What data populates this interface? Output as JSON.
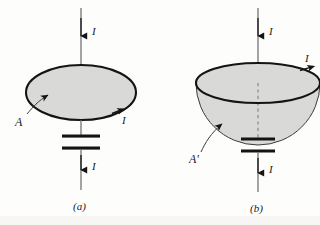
{
  "figure": {
    "background_color": "#fdfdfc",
    "ink_color": "#1a1a1a",
    "surface_fill_color": "#d9d9d7",
    "surface_edge_color": "#141414"
  },
  "panels": [
    {
      "id": "a",
      "caption": "(a)",
      "surface_name": "flat-disk-surface",
      "surface_label": "A",
      "labels": {
        "current_top": "I",
        "current_loop": "I",
        "current_bottom": "I",
        "area": "A"
      },
      "elements": {
        "wire_name": "current-carrying-wire",
        "capacitor_name": "parallel-plate-capacitor",
        "loop_name": "amperian-loop",
        "leader_name": "area-leader-line"
      }
    },
    {
      "id": "b",
      "caption": "(b)",
      "surface_name": "bowl-shaped-surface",
      "surface_label": "A'",
      "labels": {
        "current_top": "I",
        "current_loop": "I",
        "current_bottom": "I",
        "area": "A'"
      },
      "elements": {
        "wire_name": "current-carrying-wire",
        "capacitor_name": "parallel-plate-capacitor",
        "loop_name": "amperian-loop",
        "leader_name": "area-leader-line"
      }
    }
  ]
}
